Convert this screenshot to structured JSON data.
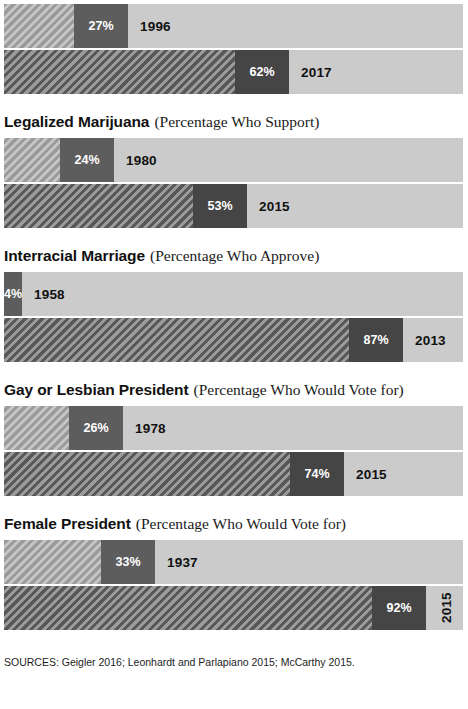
{
  "figure": {
    "sources_label": "SOURCES: Geigler 2016; Leonhardt and Parlapiano 2015; McCarthy 2015.",
    "colors": {
      "track": "#cbcbcb",
      "hatch_old": "#9b9b9b",
      "hatch_new": "#585858",
      "pct_block": "#4a4a4a",
      "pct_text": "#ffffff",
      "year_text": "#111111",
      "background": "#ffffff"
    }
  },
  "chart_data": {
    "type": "bar",
    "xlabel": "",
    "ylabel": "",
    "xlim": [
      0,
      100
    ],
    "grid": false,
    "legend": "none",
    "orientation": "horizontal",
    "note": "Each topic shows two stacked horizontal bars: an earlier year and a later year, with the percentage of respondents.",
    "categories": [
      "Same-Sex Marriage",
      "Legalized Marijuana",
      "Interracial Marriage",
      "Gay or Lesbian President",
      "Female President"
    ],
    "series": [
      {
        "name": "Earlier year",
        "values": [
          27,
          24,
          4,
          26,
          33
        ]
      },
      {
        "name": "Later year",
        "values": [
          62,
          53,
          87,
          74,
          92
        ]
      }
    ],
    "groups": [
      {
        "title": "Same-Sex Marriage",
        "subtitle": "(Percentage Who Favor)",
        "title_clipped": true,
        "bars": [
          {
            "year": "1996",
            "pct": 27,
            "pct_label": "27%",
            "style": "old"
          },
          {
            "year": "2017",
            "pct": 62,
            "pct_label": "62%",
            "style": "new"
          }
        ]
      },
      {
        "title": "Legalized Marijuana",
        "subtitle": "(Percentage Who Support)",
        "title_clipped": false,
        "bars": [
          {
            "year": "1980",
            "pct": 24,
            "pct_label": "24%",
            "style": "old"
          },
          {
            "year": "2015",
            "pct": 53,
            "pct_label": "53%",
            "style": "new"
          }
        ]
      },
      {
        "title": "Interracial Marriage",
        "subtitle": "(Percentage Who Approve)",
        "title_clipped": false,
        "bars": [
          {
            "year": "1958",
            "pct": 4,
            "pct_label": "4%",
            "style": "old-tiny"
          },
          {
            "year": "2013",
            "pct": 87,
            "pct_label": "87%",
            "style": "new"
          }
        ]
      },
      {
        "title": "Gay or Lesbian President",
        "subtitle": "(Percentage Who Would Vote for)",
        "title_clipped": false,
        "bars": [
          {
            "year": "1978",
            "pct": 26,
            "pct_label": "26%",
            "style": "old"
          },
          {
            "year": "2015",
            "pct": 74,
            "pct_label": "74%",
            "style": "new"
          }
        ]
      },
      {
        "title": "Female President",
        "subtitle": "(Percentage Who Would Vote for)",
        "title_clipped": false,
        "bars": [
          {
            "year": "1937",
            "pct": 33,
            "pct_label": "33%",
            "style": "old"
          },
          {
            "year": "2015",
            "pct": 92,
            "pct_label": "92%",
            "style": "new",
            "year_rotated": true
          }
        ]
      }
    ]
  }
}
